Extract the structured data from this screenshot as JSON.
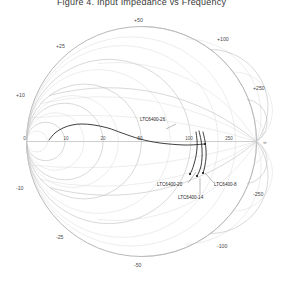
{
  "chart_data": {
    "type": "scatter",
    "chart_kind": "smith-chart",
    "title": "Figure 4. Input Impedance vs Frequency",
    "xlabel": "",
    "ylabel": "",
    "grid": true,
    "legend_position": "inline-annotations",
    "resistance_ticks": [
      "0",
      "10",
      "20",
      "50",
      "100",
      "250"
    ],
    "reactance_ticks_upper": [
      "+10",
      "+25",
      "+50",
      "+100",
      "+250"
    ],
    "reactance_ticks_lower": [
      "-10",
      "-25",
      "-50",
      "-100",
      "-250"
    ],
    "axis_right_label": "∞",
    "normalizing_impedance": "50",
    "series": [
      {
        "name": "LTC6400-26",
        "label": "LTC6400-26",
        "color": "#1c1c1c",
        "label_x": 140,
        "label_y": 121,
        "points": [
          [
            49,
            140
          ],
          [
            55,
            133
          ],
          [
            63,
            128
          ],
          [
            72,
            125
          ],
          [
            82,
            124
          ],
          [
            94,
            125
          ],
          [
            108,
            128
          ],
          [
            122,
            133
          ],
          [
            140,
            139
          ],
          [
            160,
            143
          ],
          [
            185,
            145
          ],
          [
            205,
            144
          ]
        ]
      },
      {
        "name": "LTC6400-20",
        "label": "LTC6400-20",
        "color": "#1c1c1c",
        "label_x": 157,
        "label_y": 186,
        "points": [
          [
            196,
            132
          ],
          [
            197,
            140
          ],
          [
            197,
            148
          ],
          [
            196,
            156
          ],
          [
            194,
            164
          ],
          [
            192,
            170
          ],
          [
            190,
            174
          ]
        ]
      },
      {
        "name": "LTC6400-14",
        "label": "LTC6400-14",
        "color": "#1c1c1c",
        "label_x": 178,
        "label_y": 199,
        "points": [
          [
            199,
            131
          ],
          [
            201,
            140
          ],
          [
            202,
            149
          ],
          [
            202,
            158
          ],
          [
            201,
            166
          ],
          [
            199,
            172
          ],
          [
            197,
            176
          ]
        ]
      },
      {
        "name": "LTC6400-8",
        "label": "LTC6400-8",
        "color": "#1c1c1c",
        "label_x": 214,
        "label_y": 186,
        "points": [
          [
            203,
            132
          ],
          [
            205,
            141
          ],
          [
            206,
            150
          ],
          [
            206,
            158
          ],
          [
            205,
            165
          ],
          [
            204,
            170
          ],
          [
            203,
            173
          ]
        ]
      }
    ]
  },
  "tick_labels": {
    "r_0": "0",
    "r_10": "10",
    "r_20": "20",
    "r_50": "50",
    "r_100": "100",
    "r_250": "250",
    "x_p10": "+10",
    "x_p25": "+25",
    "x_p50": "+50",
    "x_p100": "+100",
    "x_p250": "+250",
    "x_m10": "-10",
    "x_m25": "-25",
    "x_m50": "-50",
    "x_m100": "-100",
    "x_m250": "-250",
    "infinity": "∞"
  },
  "annotations": {
    "a1": "LTC6400-26",
    "a2": "LTC6400-20",
    "a3": "LTC6400-14",
    "a4": "LTC6400-8"
  },
  "header": {
    "title": "Figure 4. Input Impedance vs Frequency"
  }
}
